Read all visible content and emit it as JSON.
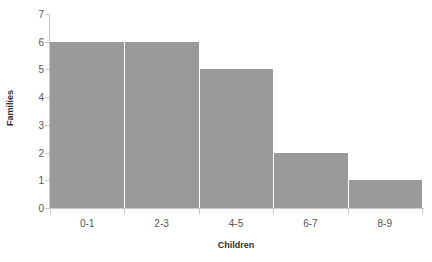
{
  "chart_data": {
    "type": "bar",
    "title": "",
    "subtitle": "",
    "xlabel": "Children",
    "ylabel": "Families",
    "categories": [
      "0-1",
      "2-3",
      "4-5",
      "6-7",
      "8-9"
    ],
    "values": [
      6,
      6,
      5,
      2,
      1
    ],
    "series": [
      {
        "name": "Families",
        "values": [
          6,
          6,
          5,
          2,
          1
        ]
      }
    ],
    "ylim": [
      0,
      7
    ],
    "y_ticks": [
      0,
      1,
      2,
      3,
      4,
      5,
      6,
      7
    ],
    "y_tick_labels": [
      "0",
      "1",
      "2",
      "3",
      "4",
      "5",
      "6",
      "7"
    ],
    "x_tick_labels": [
      "0-1",
      "2-3",
      "4-5",
      "6-7",
      "8-9"
    ],
    "grid": false,
    "legend": false,
    "legend_position": "none",
    "bar_gap": 0,
    "colors": {
      "bar_fill": "#9a9a9a",
      "bar_separator": "#ffffff",
      "axis_line": "#c8c8c8",
      "tick_label": "#555555",
      "axis_title": "#2e2e2e",
      "background": "#ffffff"
    }
  }
}
